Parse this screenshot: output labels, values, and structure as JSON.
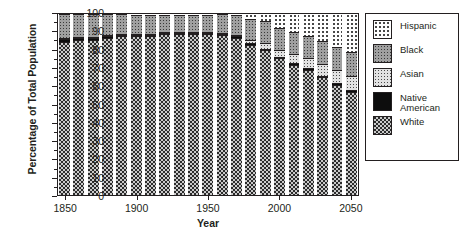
{
  "chart_data": {
    "type": "bar",
    "subtype": "stacked-100-percent",
    "title": "",
    "xlabel": "Year",
    "ylabel": "Percentage of Total Population",
    "ylim": [
      0,
      100
    ],
    "ytick_step": 10,
    "yminor_step": 5,
    "xlim": [
      1845,
      2055
    ],
    "grid": false,
    "legend_position": "right-outside",
    "categories": [
      1850,
      1860,
      1870,
      1880,
      1890,
      1900,
      1910,
      1920,
      1930,
      1940,
      1950,
      1960,
      1970,
      1980,
      1990,
      2000,
      2010,
      2020,
      2030,
      2040,
      2050
    ],
    "yticks": [
      0,
      10,
      20,
      30,
      40,
      50,
      60,
      70,
      80,
      90,
      100
    ],
    "xticks": [
      1850,
      1900,
      1950,
      2000,
      2050
    ],
    "series": [
      {
        "name": "White",
        "fill": "dark-checkered",
        "values": [
          85,
          86,
          86,
          87,
          88,
          88,
          88.5,
          89,
          89,
          89,
          89,
          88.5,
          87,
          83,
          80,
          75.5,
          72,
          69,
          65,
          61,
          57
        ]
      },
      {
        "name": "Native American",
        "fill": "solid-black",
        "values": [
          1.5,
          1.2,
          1,
          0.9,
          0.8,
          0.7,
          0.6,
          0.5,
          0.5,
          0.5,
          0.5,
          0.6,
          0.7,
          0.8,
          0.9,
          1,
          1,
          1,
          1,
          1,
          1
        ]
      },
      {
        "name": "Asian",
        "fill": "light-gray-dots",
        "values": [
          0.1,
          0.2,
          0.3,
          0.3,
          0.3,
          0.3,
          0.3,
          0.3,
          0.3,
          0.3,
          0.3,
          0.5,
          0.8,
          1.6,
          2.9,
          3.8,
          4.7,
          5.5,
          6.4,
          7.2,
          8
        ]
      },
      {
        "name": "Black",
        "fill": "gray-dots",
        "values": [
          13.4,
          12.6,
          12.7,
          11.8,
          10.9,
          10.7,
          10.6,
          9.9,
          9.7,
          9.8,
          9.9,
          10.4,
          11,
          11.6,
          12.2,
          12.2,
          12.3,
          12.5,
          12.6,
          12.8,
          13
        ]
      },
      {
        "name": "Hispanic",
        "fill": "white-dots",
        "values": [
          0,
          0,
          0,
          0,
          0.1,
          0.3,
          0.6,
          0.3,
          0.5,
          0.4,
          0.3,
          0,
          0.5,
          3,
          4,
          7.5,
          10,
          12,
          15,
          18,
          21
        ]
      }
    ]
  },
  "legend": {
    "items": [
      {
        "label": "Hispanic",
        "label2": "",
        "fill": "white-dots"
      },
      {
        "label": "Black",
        "label2": "",
        "fill": "gray-dots"
      },
      {
        "label": "Asian",
        "label2": "",
        "fill": "light-gray-dots"
      },
      {
        "label": "Native",
        "label2": "American",
        "fill": "solid-black"
      },
      {
        "label": "White",
        "label2": "",
        "fill": "dark-checkered"
      }
    ]
  },
  "axis": {
    "ylabel": "Percentage of Total Population",
    "xlabel": "Year"
  }
}
